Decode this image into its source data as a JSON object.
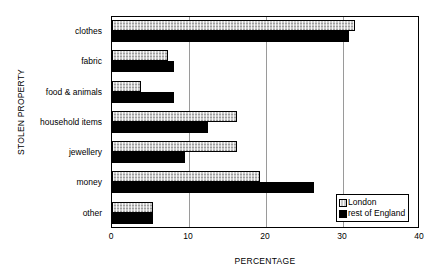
{
  "chart_data": {
    "type": "bar",
    "orientation": "horizontal",
    "title": "",
    "xlabel": "PERCENTAGE",
    "ylabel": "STOLEN PROPERTY",
    "xlim": [
      0,
      40
    ],
    "xticks": [
      0,
      10,
      20,
      30,
      40
    ],
    "grid": "vertical",
    "legend_position": "bottom-right",
    "categories": [
      "clothes",
      "fabric",
      "food & animals",
      "household items",
      "jewellery",
      "money",
      "other"
    ],
    "series": [
      {
        "name": "London",
        "color": "#c9c9c9",
        "values": [
          31.6,
          7.3,
          3.8,
          16.2,
          16.2,
          19.2,
          5.3
        ]
      },
      {
        "name": "rest of England",
        "color": "#000000",
        "values": [
          30.8,
          8.0,
          8.0,
          12.5,
          9.5,
          26.2,
          5.3
        ]
      }
    ]
  },
  "legend": {
    "items": [
      {
        "label": "London",
        "swatch": "london-swatch"
      },
      {
        "label": "rest of England",
        "swatch": "rest-of-england-swatch"
      }
    ]
  }
}
